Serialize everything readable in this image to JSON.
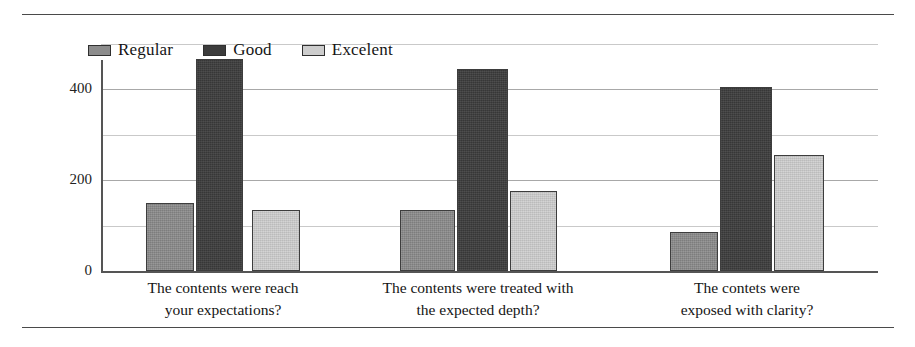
{
  "chart_data": {
    "type": "bar",
    "title": "",
    "subtitle": "",
    "xlabel": "",
    "ylabel": "",
    "ylim": [
      0,
      500
    ],
    "yticks": [
      0,
      200,
      400
    ],
    "ytick_labels": [
      "0",
      "200",
      "400"
    ],
    "minor_gridlines": [
      100,
      300,
      500
    ],
    "grid": true,
    "legend_position": "top-left",
    "categories": [
      "The contents were reach your expectations?",
      "The contents were treated with the expected depth?",
      "The contets were exposed with clarity?"
    ],
    "category_lines": [
      [
        "The contents were reach",
        "your expectations?"
      ],
      [
        "The contents were treated with",
        "the expected depth?"
      ],
      [
        "The contets were",
        "exposed with clarity?"
      ]
    ],
    "series": [
      {
        "name": "Regular",
        "color": "#8c8c8c",
        "values": [
          150,
          133,
          85
        ]
      },
      {
        "name": "Good",
        "color": "#3c3c3c",
        "values": [
          465,
          445,
          405
        ]
      },
      {
        "name": "Excelent",
        "color": "#cdcdcd",
        "values": [
          133,
          175,
          255
        ]
      }
    ]
  },
  "legend": {
    "items": [
      {
        "label": "Regular",
        "swatch": "legend-swatch-regular"
      },
      {
        "label": "Good",
        "swatch": "legend-swatch-good"
      },
      {
        "label": "Excelent",
        "swatch": "legend-swatch-excelent"
      }
    ]
  },
  "axis": {
    "y_tick_0": "0",
    "y_tick_200": "200",
    "y_tick_400": "400"
  },
  "colors": {
    "regular": "#8c8c8c",
    "good": "#3c3c3c",
    "excelent": "#cdcdcd",
    "gridline": "#c9c9c9",
    "axis": "#555555",
    "rule": "#4a4a4a",
    "background": "#ffffff"
  }
}
